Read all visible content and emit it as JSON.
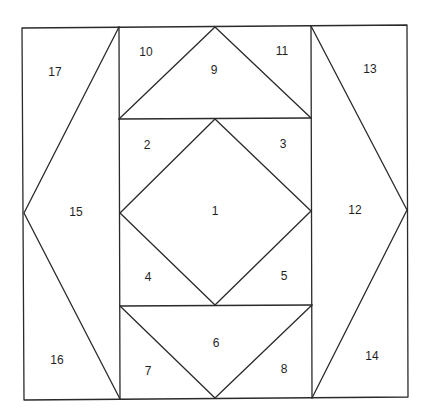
{
  "diagram": {
    "type": "quilt-block-foundation-pattern",
    "stroke_color": "#2a2a2a",
    "background": "#ffffff",
    "outer_square": {
      "x1": 22,
      "y1": 26,
      "x2": 408,
      "y2": 399
    },
    "pieces": [
      {
        "id": "1",
        "label": "1",
        "x": 215,
        "y": 212
      },
      {
        "id": "2",
        "label": "2",
        "x": 147,
        "y": 146
      },
      {
        "id": "3",
        "label": "3",
        "x": 283,
        "y": 145
      },
      {
        "id": "4",
        "label": "4",
        "x": 148,
        "y": 278
      },
      {
        "id": "5",
        "label": "5",
        "x": 284,
        "y": 277
      },
      {
        "id": "6",
        "label": "6",
        "x": 216,
        "y": 344
      },
      {
        "id": "7",
        "label": "7",
        "x": 148,
        "y": 372
      },
      {
        "id": "8",
        "label": "8",
        "x": 284,
        "y": 370
      },
      {
        "id": "9",
        "label": "9",
        "x": 214,
        "y": 71
      },
      {
        "id": "10",
        "label": "10",
        "x": 146,
        "y": 53
      },
      {
        "id": "11",
        "label": "11",
        "x": 282,
        "y": 52
      },
      {
        "id": "12",
        "label": "12",
        "x": 355,
        "y": 211
      },
      {
        "id": "13",
        "label": "13",
        "x": 370,
        "y": 70
      },
      {
        "id": "14",
        "label": "14",
        "x": 372,
        "y": 357
      },
      {
        "id": "15",
        "label": "15",
        "x": 76,
        "y": 213
      },
      {
        "id": "16",
        "label": "16",
        "x": 57,
        "y": 361
      },
      {
        "id": "17",
        "label": "17",
        "x": 55,
        "y": 73
      }
    ]
  }
}
